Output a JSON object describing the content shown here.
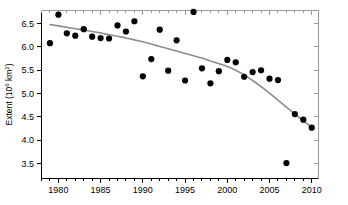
{
  "chart_data": {
    "type": "scatter",
    "title": "",
    "subtitle": "",
    "xlabel": "",
    "ylabel": "Extent (10⁶ km²)",
    "ylabel_parts": {
      "text": "Extent (10",
      "sup": "6",
      "tail": " km",
      "sup2": "2",
      "close": ")"
    },
    "xlim": [
      1978.0,
      2010.8
    ],
    "ylim": [
      3.18,
      6.78
    ],
    "xticks": [
      1980,
      1985,
      1990,
      1995,
      2000,
      2005,
      2010
    ],
    "xticklabels": [
      "1980",
      "1985",
      "1990",
      "1995",
      "2000",
      "2005",
      "2010"
    ],
    "xminor_step": 1,
    "yticks": [
      3.5,
      4.0,
      4.5,
      5.0,
      5.5,
      6.0,
      6.5
    ],
    "yticklabels": [
      "3.5",
      "4.0",
      "4.5",
      "5.0",
      "5.5",
      "6.0",
      "6.5"
    ],
    "grid": false,
    "legend": null,
    "marker": {
      "shape": "circle",
      "color": "#000000",
      "size_px": 3.1
    },
    "x": [
      1979,
      1980,
      1981,
      1982,
      1983,
      1984,
      1985,
      1986,
      1987,
      1988,
      1989,
      1990,
      1991,
      1992,
      1993,
      1994,
      1995,
      1996,
      1997,
      1998,
      1999,
      2000,
      2001,
      2002,
      2003,
      2004,
      2005,
      2006,
      2007,
      2008,
      2009,
      2010
    ],
    "values": [
      6.08,
      6.69,
      6.29,
      6.24,
      6.38,
      6.22,
      6.19,
      6.18,
      6.46,
      6.33,
      6.55,
      5.37,
      5.74,
      6.37,
      5.49,
      6.14,
      5.28,
      6.75,
      5.54,
      5.22,
      5.48,
      5.72,
      5.67,
      5.36,
      5.46,
      5.5,
      5.32,
      5.29,
      3.51,
      4.56,
      4.44,
      4.27
    ],
    "trend": {
      "name": "smoothed trend",
      "color": "#8c8c8c",
      "x": [
        1979,
        1980,
        1981,
        1982,
        1983,
        1984,
        1985,
        1986,
        1987,
        1988,
        1989,
        1990,
        1991,
        1992,
        1993,
        1994,
        1995,
        1996,
        1997,
        1998,
        1999,
        2000,
        2001,
        2002,
        2003,
        2004,
        2005,
        2006,
        2007,
        2008,
        2009,
        2010
      ],
      "values": [
        6.48,
        6.45,
        6.42,
        6.39,
        6.36,
        6.33,
        6.3,
        6.26,
        6.23,
        6.19,
        6.15,
        6.11,
        6.06,
        6.01,
        5.96,
        5.91,
        5.86,
        5.81,
        5.76,
        5.7,
        5.64,
        5.58,
        5.5,
        5.4,
        5.28,
        5.15,
        5.01,
        4.86,
        4.71,
        4.56,
        4.42,
        4.28
      ]
    },
    "axes_style": {
      "left_axis_color": "#000000",
      "bottom_axis_color": "#000000",
      "right_axis_color": "#9a9a9a",
      "top_axis_color": "#9a9a9a"
    }
  }
}
